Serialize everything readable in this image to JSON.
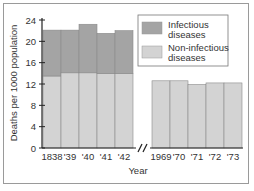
{
  "chart_data": {
    "type": "bar",
    "stacked": true,
    "title": "",
    "xlabel": "Year",
    "ylabel": "Deaths per 1000 population",
    "ylim": [
      0,
      24
    ],
    "yticks": [
      0,
      4,
      8,
      12,
      16,
      20,
      24
    ],
    "grid": false,
    "legend_position": "upper right",
    "axis_break": "between '42 and 1969",
    "categories": [
      "1838",
      "'39",
      "'40",
      "'41",
      "'42",
      "1969",
      "'70",
      "'71",
      "'72",
      "'73"
    ],
    "series": [
      {
        "name": "Non-infectious diseases",
        "color": "#d3d3d3",
        "values": [
          13.5,
          14.1,
          14.1,
          14.0,
          14.0,
          12.6,
          12.6,
          11.9,
          12.2,
          12.2
        ]
      },
      {
        "name": "Infectious diseases",
        "color": "#a4a4a4",
        "values": [
          8.6,
          8.0,
          9.1,
          7.5,
          8.0,
          0,
          0,
          0,
          0,
          0
        ]
      }
    ],
    "totals": [
      22.1,
      22.1,
      23.2,
      21.5,
      22.0,
      12.6,
      12.6,
      11.9,
      12.2,
      12.2
    ]
  },
  "legend": {
    "items": [
      {
        "line1": "Infectious",
        "line2": "diseases",
        "color": "#a4a4a4"
      },
      {
        "line1": "Non-infectious",
        "line2": "diseases",
        "color": "#d3d3d3"
      }
    ]
  },
  "axes": {
    "x_title": "Year",
    "y_title": "Deaths per 1000 population",
    "y_tick_labels": [
      "0",
      "4",
      "8",
      "12",
      "16",
      "20",
      "24"
    ],
    "x_tick_labels": [
      "1838",
      "'39",
      "'40",
      "'41",
      "'42",
      "1969",
      "'70",
      "'71",
      "'72",
      "'73"
    ]
  }
}
